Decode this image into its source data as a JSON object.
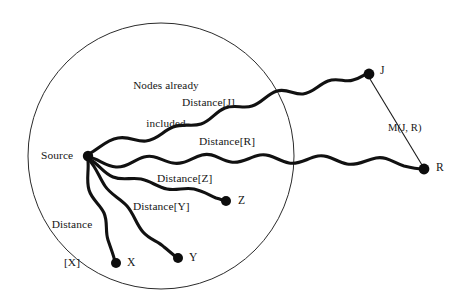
{
  "diagram": {
    "region_label": "Nodes already\nincluded",
    "region_label_line1": "Nodes already",
    "region_label_line2": "included",
    "colors": {
      "background": "#ffffff",
      "wavy_path": "#111111",
      "node_fill": "#0d0d0d",
      "boundary": "#2b2b2b",
      "straight_edge": "#1a1a1a",
      "text": "#161616"
    },
    "nodes": [
      {
        "id": "source",
        "label": "Source",
        "x": 88,
        "y": 156,
        "radius": 5.2,
        "label_x": 41,
        "label_y": 149
      },
      {
        "id": "j",
        "label": "J",
        "x": 369,
        "y": 74,
        "radius": 5.4,
        "label_x": 380,
        "label_y": 64
      },
      {
        "id": "r",
        "label": "R",
        "x": 424,
        "y": 169,
        "radius": 5.4,
        "label_x": 436,
        "label_y": 161
      },
      {
        "id": "x",
        "label": "X",
        "x": 116,
        "y": 263,
        "radius": 5.0,
        "label_x": 127,
        "label_y": 256
      },
      {
        "id": "y",
        "label": "Y",
        "x": 178,
        "y": 258,
        "radius": 5.0,
        "label_x": 189,
        "label_y": 251
      },
      {
        "id": "z",
        "label": "Z",
        "x": 226,
        "y": 201,
        "radius": 5.0,
        "label_x": 238,
        "label_y": 194
      }
    ],
    "path_labels": [
      {
        "id": "dist-j",
        "label": "Distance[J]",
        "x": 182,
        "y": 96
      },
      {
        "id": "dist-r",
        "label": "Distance[R]",
        "x": 199,
        "y": 135
      },
      {
        "id": "dist-z",
        "label": "Distance[Z]",
        "x": 157,
        "y": 172
      },
      {
        "id": "dist-y",
        "label": "Distance[Y]",
        "x": 133,
        "y": 200
      }
    ],
    "dist_x_label": {
      "id": "dist-x",
      "line1": "Distance",
      "line2": "[X]",
      "x": 44,
      "y": 192
    },
    "metric_label": {
      "id": "metric-jr",
      "label": "M(J, R)",
      "x": 388,
      "y": 122
    },
    "region_label_pos": {
      "x": 118,
      "y": 54,
      "width": 96
    },
    "boundary": {
      "cx": 161,
      "cy": 156,
      "r": 133
    }
  }
}
